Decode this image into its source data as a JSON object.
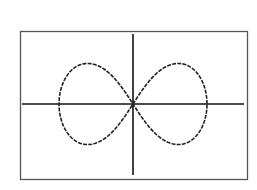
{
  "chart_data": {
    "type": "line",
    "title": "",
    "xlabel": "",
    "ylabel": "",
    "equation_form": "r^2 = a^2 cos(2θ)",
    "grid": false,
    "legend": null,
    "axes": {
      "x_visible": true,
      "y_visible": true,
      "ticks": false
    },
    "series": [
      {
        "name": "lemniscate",
        "points_approx": [
          [
            -1,
            0
          ],
          [
            -0.75,
            0.33
          ],
          [
            -0.5,
            0.35
          ],
          [
            -0.25,
            0.24
          ],
          [
            0,
            0
          ],
          [
            0.25,
            0.24
          ],
          [
            0.5,
            0.35
          ],
          [
            0.75,
            0.33
          ],
          [
            1,
            0
          ],
          [
            0.75,
            -0.33
          ],
          [
            0.5,
            -0.35
          ],
          [
            0.25,
            -0.24
          ],
          [
            0,
            0
          ],
          [
            -0.25,
            -0.24
          ],
          [
            -0.5,
            -0.35
          ],
          [
            -0.75,
            -0.33
          ],
          [
            -1,
            0
          ]
        ]
      }
    ],
    "colors": {
      "curve": "#222222",
      "axes": "#111111",
      "frame": "#555555",
      "background": "#ffffff"
    }
  }
}
